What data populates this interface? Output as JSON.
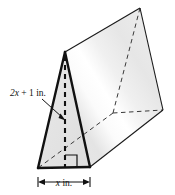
{
  "figure": {
    "shape_name": "triangular-prism",
    "labels": {
      "height_label": "2x + 1 in.",
      "height_label_var": "x",
      "height_label_prefix": "2",
      "height_label_suffix": " + 1 in.",
      "base_label": "x in.",
      "base_label_var": "x",
      "base_label_suffix": " in."
    },
    "annotations": {
      "right_angle_marker": "right-angle",
      "altitude_style": "dashed",
      "hidden_edges_style": "dashed",
      "leader_line": "arrow pointing from height label to altitude"
    },
    "colors": {
      "outline": "#1a1a1a",
      "hidden_edge": "#333333",
      "front_face_fill": "#e4e4e4",
      "side_face_fill": "#ececec",
      "side_face_highlight": "#fafafa",
      "top_face_fill": "#f4f4f4",
      "background": "#ffffff",
      "text": "#111111"
    },
    "geometry": {
      "front_apex": [
        65,
        52
      ],
      "front_bottom_left": [
        38,
        168
      ],
      "front_bottom_right": [
        90,
        167
      ],
      "back_apex": [
        140,
        8
      ],
      "back_bottom_right": [
        163,
        110
      ],
      "back_bottom_hidden": [
        113,
        113
      ],
      "altitude_foot": [
        65,
        167
      ]
    },
    "dimension_line": {
      "y": 182,
      "x_start": 38,
      "x_end": 90,
      "tick_style": "serif-arrow"
    }
  }
}
